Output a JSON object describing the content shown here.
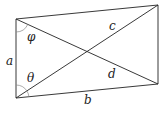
{
  "diagram": {
    "title": "",
    "stroke_color": "#222222",
    "arc_color": "#888888",
    "vertices": {
      "top_left": [
        16,
        19
      ],
      "bottom_left": [
        16,
        98
      ],
      "top_right": [
        158,
        5
      ],
      "bottom_right": [
        158,
        84
      ]
    },
    "labels": {
      "side_left": "a",
      "side_bottom": "b",
      "diagonal_up": "c",
      "diagonal_down": "d",
      "angle_top": "φ",
      "angle_bottom": "θ"
    }
  }
}
